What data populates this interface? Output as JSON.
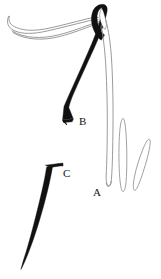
{
  "figure": {
    "background_color": "#ffffff",
    "ink_color": "#111111",
    "thread_color": "#8c8c8c",
    "width": 161,
    "height": 279,
    "labels": [
      {
        "id": "A",
        "text": "A",
        "meaning": "thread loop",
        "x": 93,
        "y": 187
      },
      {
        "id": "B",
        "text": "B",
        "meaning": "threaded needle",
        "x": 79,
        "y": 116
      },
      {
        "id": "C",
        "text": "C",
        "meaning": "bristle / awl",
        "x": 63,
        "y": 168
      }
    ],
    "parts": [
      {
        "name": "needle-body-B",
        "type": "solid-black-tapered-shaft",
        "color": "#111111"
      },
      {
        "name": "needle-eye",
        "type": "elongated-oval-opening",
        "color": "#ffffff"
      },
      {
        "name": "thread-curve-left",
        "type": "doubled-curved-line",
        "color": "#8c8c8c"
      },
      {
        "name": "thread-loop-A",
        "type": "long-narrow-u-loop",
        "color": "#8c8c8c"
      },
      {
        "name": "thread-oval-middle",
        "type": "elongated-oval-outline",
        "color": "#8c8c8c"
      },
      {
        "name": "thread-oval-right",
        "type": "elongated-oval-outline-tilted",
        "color": "#8c8c8c"
      },
      {
        "name": "bristle-C",
        "type": "solid-black-tapered-spike-with-flared-head",
        "color": "#111111"
      }
    ]
  }
}
